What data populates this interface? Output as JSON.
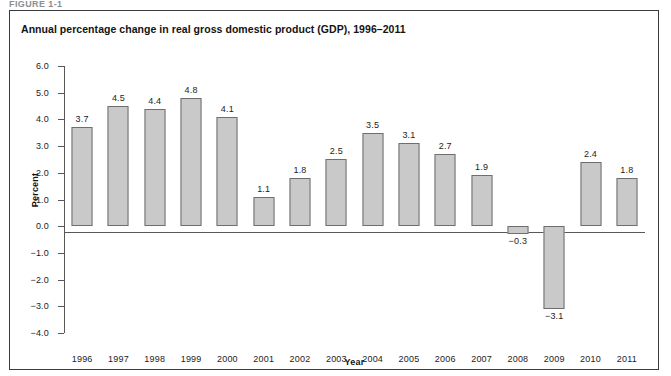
{
  "figure_caption_partial": "FIGURE 1-1",
  "chart_data": {
    "type": "bar",
    "title": "Annual percentage change in real gross domestic product (GDP), 1996–2011",
    "xlabel": "Year",
    "ylabel": "Percent",
    "ylim": [
      -4.0,
      6.0
    ],
    "ytick_labels": [
      "6.0",
      "5.0",
      "4.0",
      "3.0",
      "2.0",
      "1.0",
      "0.0",
      "−1.0",
      "−2.0",
      "−3.0",
      "−4.0"
    ],
    "ytick_values": [
      6.0,
      5.0,
      4.0,
      3.0,
      2.0,
      1.0,
      0.0,
      -1.0,
      -2.0,
      -3.0,
      -4.0
    ],
    "grid": false,
    "legend": "none",
    "bar_color": "#c9c9c9",
    "bar_border_color": "#6e6e70",
    "axis_color": "#58585a",
    "categories": [
      "1996",
      "1997",
      "1998",
      "1999",
      "2000",
      "2001",
      "2002",
      "2003",
      "2004",
      "2005",
      "2006",
      "2007",
      "2008",
      "2009",
      "2010",
      "2011"
    ],
    "values": [
      3.7,
      4.5,
      4.4,
      4.8,
      4.1,
      1.1,
      1.8,
      2.5,
      3.5,
      3.1,
      2.7,
      1.9,
      -0.3,
      -3.1,
      2.4,
      1.8
    ],
    "data_labels": [
      "3.7",
      "4.5",
      "4.4",
      "4.8",
      "4.1",
      "1.1",
      "1.8",
      "2.5",
      "3.5",
      "3.1",
      "2.7",
      "1.9",
      "−0.3",
      "−3.1",
      "2.4",
      "1.8"
    ]
  }
}
